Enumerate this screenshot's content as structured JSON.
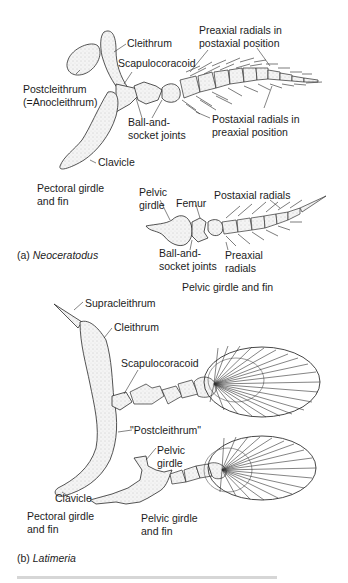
{
  "figure": {
    "panels": [
      {
        "id": "a",
        "tag": "(a)",
        "species": "Neoceratodus",
        "pectoral": {
          "caption": [
            "Pectoral girdle",
            "and fin"
          ],
          "labels": {
            "cleithrum": "Cleithrum",
            "scapulocoracoid": "Scapulocoracoid",
            "postcleithrum": [
              "Postcleithrum",
              "(=Anocleithrum)"
            ],
            "ball_socket": [
              "Ball-and-",
              "socket joints"
            ],
            "clavicle": "Clavicle",
            "preaxial_in_postaxial": [
              "Preaxial radials in",
              "postaxial position"
            ],
            "postaxial_in_preaxial": [
              "Postaxial radials in",
              "preaxial position"
            ]
          }
        },
        "pelvic": {
          "caption": "Pelvic girdle and fin",
          "labels": {
            "pelvic_girdle": [
              "Pelvic",
              "girdle"
            ],
            "femur": "Femur",
            "postaxial_radials": "Postaxial radials",
            "ball_socket": [
              "Ball-and-",
              "socket joints"
            ],
            "preaxial_radials": [
              "Preaxial",
              "radials"
            ]
          }
        }
      },
      {
        "id": "b",
        "tag": "(b)",
        "species": "Latimeria",
        "pectoral": {
          "caption": [
            "Pectoral girdle",
            "and fin"
          ],
          "labels": {
            "supracleithrum": "Supracleithrum",
            "cleithrum": "Cleithrum",
            "scapulocoracoid": "Scapulocoracoid",
            "postcleithrum": "\"Postcleithrum\"",
            "clavicle": "Clavicle"
          }
        },
        "pelvic": {
          "caption": [
            "Pelvic girdle",
            "and fin"
          ],
          "labels": {
            "pelvic_girdle": [
              "Pelvic",
              "girdle"
            ]
          }
        }
      }
    ]
  }
}
